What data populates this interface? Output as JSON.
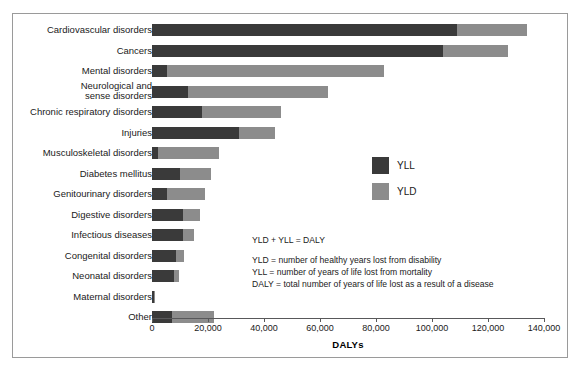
{
  "chart_data": {
    "type": "bar",
    "orientation": "horizontal",
    "stacked": true,
    "title": "",
    "xlabel": "DALYs",
    "ylabel": "",
    "xlim": [
      0,
      140000
    ],
    "xticks": [
      0,
      20000,
      40000,
      60000,
      80000,
      100000,
      120000,
      140000
    ],
    "xtick_labels": [
      "0",
      "20,000",
      "40,000",
      "60,000",
      "80,000",
      "100,000",
      "120,000",
      "140,000"
    ],
    "grid": false,
    "legend_position": "center-right",
    "categories": [
      "Cardiovascular disorders",
      "Cancers",
      "Mental disorders",
      "Neurological and\nsense disorders",
      "Chronic respiratory disorders",
      "Injuries",
      "Musculoskeletal disorders",
      "Diabetes mellitus",
      "Genitourinary disorders",
      "Digestive disorders",
      "Infectious diseases",
      "Congenital disorders",
      "Neonatal disorders",
      "Maternal disorders",
      "Other"
    ],
    "series": [
      {
        "name": "YLL",
        "color": "#3a3a3a",
        "values": [
          109000,
          104000,
          5500,
          13000,
          18000,
          31000,
          2000,
          10000,
          5500,
          11000,
          11000,
          8500,
          8000,
          700,
          7000
        ]
      },
      {
        "name": "YLD",
        "color": "#8c8c8c",
        "values": [
          25000,
          23000,
          77500,
          50000,
          28000,
          13000,
          22000,
          11000,
          13500,
          6000,
          4000,
          3000,
          1500,
          300,
          15000
        ]
      }
    ],
    "totals": [
      134000,
      127000,
      83000,
      63000,
      46000,
      44000,
      24000,
      21000,
      19000,
      17000,
      15000,
      11500,
      9500,
      1000,
      22000
    ]
  },
  "legend": {
    "items": [
      {
        "label": "YLL",
        "color": "#3a3a3a"
      },
      {
        "label": "YLD",
        "color": "#8c8c8c"
      }
    ]
  },
  "notes": {
    "equation": "YLD + YLL = DALY",
    "lines": [
      "YLD = number of healthy years lost from disability",
      "YLL = number of years of life lost from mortality",
      "DALY = total number of years of life lost as a result of a disease"
    ]
  }
}
